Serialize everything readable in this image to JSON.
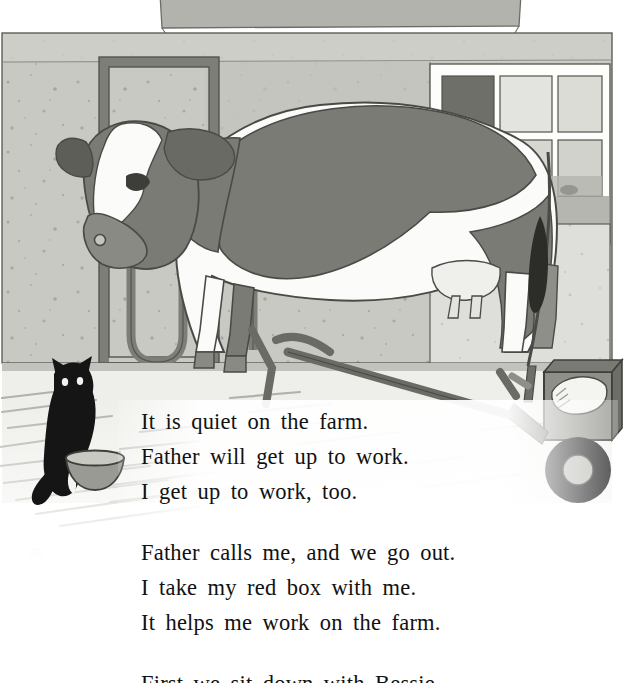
{
  "page": {
    "type": "storybook-illustrated-page",
    "background_color": "#ffffff",
    "width": 630,
    "height": 683
  },
  "illustration": {
    "name": "barn-interior-with-cow",
    "caption_alt": "A black and white cow stands in a barn stanchion beside a window; a black cat sits by a bowl on the straw-covered floor at left and a hand cart with a box rests at right.",
    "palette": {
      "wall": "#c9c9c4",
      "wall_speckle": "#8e8e88",
      "roof_band": "#b3b3ae",
      "metal_frame": "#8a8a84",
      "metal_frame_dark": "#6e6e68",
      "cow_dark": "#7b7b75",
      "cow_white": "#fbfbf9",
      "cow_outline": "#4a4a46",
      "cat_black": "#151515",
      "bowl": "#9a9a94",
      "cart_body": "#8f8f89",
      "cart_frame": "#6b6b66",
      "wheel_tire": "#1b1b1b",
      "wheel_hub": "#b9b9b4",
      "floor": "#f3f3f0",
      "straw": "#a7a7a1",
      "window_frame": "#fdfdfb",
      "window_pane_light": "#d8d8d3",
      "window_pane_dark": "#6f6f69"
    },
    "elements": [
      {
        "name": "roof-band",
        "label": "Roof edge band"
      },
      {
        "name": "back-wall",
        "label": "Speckled barn wall"
      },
      {
        "name": "stanchion-frame",
        "label": "Metal stanchion gate"
      },
      {
        "name": "cow",
        "label": "Bessie the cow"
      },
      {
        "name": "window",
        "label": "Barn window with panes"
      },
      {
        "name": "cat",
        "label": "Black cat"
      },
      {
        "name": "bowl",
        "label": "Milk bowl"
      },
      {
        "name": "hand-cart",
        "label": "Hand cart with box"
      },
      {
        "name": "straw-floor",
        "label": "Straw covered floor"
      }
    ]
  },
  "body_text": {
    "text_color": "#111111",
    "paragraphs": [
      {
        "id": "paragraph-1",
        "lines": [
          "It is quiet on the farm.",
          "Father will get up to work.",
          "I get up to work, too."
        ]
      },
      {
        "id": "paragraph-2",
        "lines": [
          "Father calls me, and we go out.",
          "I take my red box with me.",
          "It helps me work on the farm."
        ]
      },
      {
        "id": "paragraph-3",
        "lines": [
          "First we sit down with Bessie."
        ]
      }
    ]
  }
}
